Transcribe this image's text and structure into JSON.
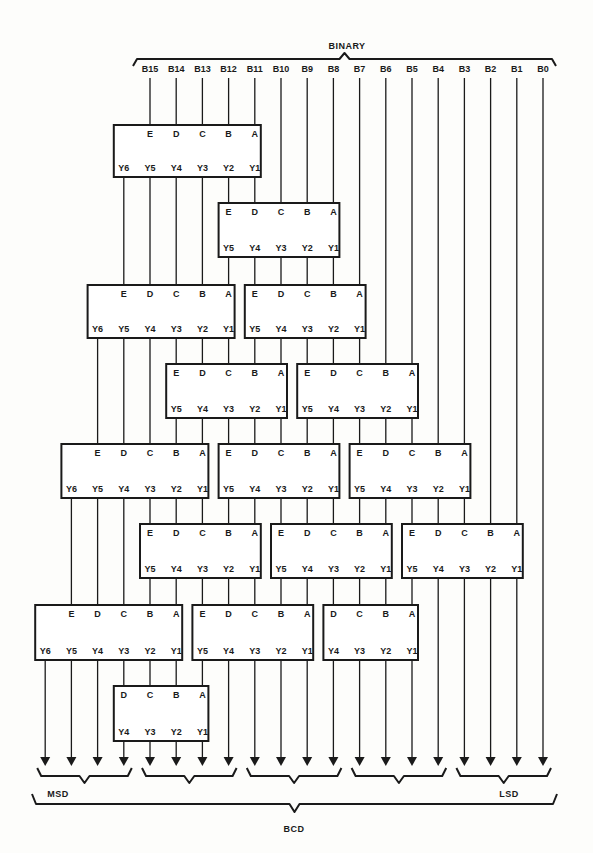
{
  "diagram": {
    "top_label": "BINARY",
    "bottom_label": "BCD",
    "msd_label": "MSD",
    "lsd_label": "LSD",
    "input_bits": [
      "B15",
      "B14",
      "B13",
      "B12",
      "B11",
      "B10",
      "B9",
      "B8",
      "B7",
      "B6",
      "B5",
      "B4",
      "B3",
      "B2",
      "B1",
      "B0"
    ],
    "column_x0": 150,
    "column_step": 26.2,
    "boxes": [
      {
        "id": "r1-a",
        "y": 125,
        "h": 52,
        "in_cols": [
          0,
          1,
          2,
          3,
          4
        ],
        "in_labels": [
          "E",
          "D",
          "C",
          "B",
          "A"
        ],
        "out_cols": [
          -1,
          0,
          1,
          2,
          3,
          4
        ],
        "out_labels": [
          "Y6",
          "Y5",
          "Y4",
          "Y3",
          "Y2",
          "Y1"
        ]
      },
      {
        "id": "r2-a",
        "y": 203,
        "h": 54,
        "in_cols": [
          3,
          4,
          5,
          6,
          7
        ],
        "in_labels": [
          "E",
          "D",
          "C",
          "B",
          "A"
        ],
        "out_cols": [
          3,
          4,
          5,
          6,
          7
        ],
        "out_labels": [
          "Y5",
          "Y4",
          "Y3",
          "Y2",
          "Y1"
        ]
      },
      {
        "id": "r3-a",
        "y": 285,
        "h": 53,
        "in_cols": [
          -1,
          0,
          1,
          2,
          3
        ],
        "in_labels": [
          "E",
          "D",
          "C",
          "B",
          "A"
        ],
        "out_cols": [
          -2,
          -1,
          0,
          1,
          2,
          3
        ],
        "out_labels": [
          "Y6",
          "Y5",
          "Y4",
          "Y3",
          "Y2",
          "Y1"
        ]
      },
      {
        "id": "r3-b",
        "y": 285,
        "h": 53,
        "in_cols": [
          4,
          5,
          6,
          7,
          8
        ],
        "in_labels": [
          "E",
          "D",
          "C",
          "B",
          "A"
        ],
        "out_cols": [
          4,
          5,
          6,
          7,
          8
        ],
        "out_labels": [
          "Y5",
          "Y4",
          "Y3",
          "Y2",
          "Y1"
        ]
      },
      {
        "id": "r4-a",
        "y": 364,
        "h": 54,
        "in_cols": [
          1,
          2,
          3,
          4,
          5
        ],
        "in_labels": [
          "E",
          "D",
          "C",
          "B",
          "A"
        ],
        "out_cols": [
          1,
          2,
          3,
          4,
          5
        ],
        "out_labels": [
          "Y5",
          "Y4",
          "Y3",
          "Y2",
          "Y1"
        ]
      },
      {
        "id": "r4-b",
        "y": 364,
        "h": 54,
        "in_cols": [
          6,
          7,
          8,
          9,
          10
        ],
        "in_labels": [
          "E",
          "D",
          "C",
          "B",
          "A"
        ],
        "out_cols": [
          6,
          7,
          8,
          9,
          10
        ],
        "out_labels": [
          "Y5",
          "Y4",
          "Y3",
          "Y2",
          "Y1"
        ]
      },
      {
        "id": "r5-a",
        "y": 444,
        "h": 54,
        "in_cols": [
          -2,
          -1,
          0,
          1,
          2
        ],
        "in_labels": [
          "E",
          "D",
          "C",
          "B",
          "A"
        ],
        "out_cols": [
          -3,
          -2,
          -1,
          0,
          1,
          2
        ],
        "out_labels": [
          "Y6",
          "Y5",
          "Y4",
          "Y3",
          "Y2",
          "Y1"
        ]
      },
      {
        "id": "r5-b",
        "y": 444,
        "h": 54,
        "in_cols": [
          3,
          4,
          5,
          6,
          7
        ],
        "in_labels": [
          "E",
          "D",
          "C",
          "B",
          "A"
        ],
        "out_cols": [
          3,
          4,
          5,
          6,
          7
        ],
        "out_labels": [
          "Y5",
          "Y4",
          "Y3",
          "Y2",
          "Y1"
        ]
      },
      {
        "id": "r5-c",
        "y": 444,
        "h": 54,
        "in_cols": [
          8,
          9,
          10,
          11,
          12
        ],
        "in_labels": [
          "E",
          "D",
          "C",
          "B",
          "A"
        ],
        "out_cols": [
          8,
          9,
          10,
          11,
          12
        ],
        "out_labels": [
          "Y5",
          "Y4",
          "Y3",
          "Y2",
          "Y1"
        ]
      },
      {
        "id": "r6-a",
        "y": 524,
        "h": 54,
        "in_cols": [
          0,
          1,
          2,
          3,
          4
        ],
        "in_labels": [
          "E",
          "D",
          "C",
          "B",
          "A"
        ],
        "out_cols": [
          0,
          1,
          2,
          3,
          4
        ],
        "out_labels": [
          "Y5",
          "Y4",
          "Y3",
          "Y2",
          "Y1"
        ]
      },
      {
        "id": "r6-b",
        "y": 524,
        "h": 54,
        "in_cols": [
          5,
          6,
          7,
          8,
          9
        ],
        "in_labels": [
          "E",
          "D",
          "C",
          "B",
          "A"
        ],
        "out_cols": [
          5,
          6,
          7,
          8,
          9
        ],
        "out_labels": [
          "Y5",
          "Y4",
          "Y3",
          "Y2",
          "Y1"
        ]
      },
      {
        "id": "r6-c",
        "y": 524,
        "h": 54,
        "in_cols": [
          10,
          11,
          12,
          13,
          14
        ],
        "in_labels": [
          "E",
          "D",
          "C",
          "B",
          "A"
        ],
        "out_cols": [
          10,
          11,
          12,
          13,
          14
        ],
        "out_labels": [
          "Y5",
          "Y4",
          "Y3",
          "Y2",
          "Y1"
        ]
      },
      {
        "id": "r7-a",
        "y": 605,
        "h": 55,
        "in_cols": [
          -3,
          -2,
          -1,
          0,
          1
        ],
        "in_labels": [
          "E",
          "D",
          "C",
          "B",
          "A"
        ],
        "out_cols": [
          -4,
          -3,
          -2,
          -1,
          0,
          1
        ],
        "out_labels": [
          "Y6",
          "Y5",
          "Y4",
          "Y3",
          "Y2",
          "Y1"
        ]
      },
      {
        "id": "r7-b",
        "y": 605,
        "h": 55,
        "in_cols": [
          2,
          3,
          4,
          5,
          6
        ],
        "in_labels": [
          "E",
          "D",
          "C",
          "B",
          "A"
        ],
        "out_cols": [
          2,
          3,
          4,
          5,
          6
        ],
        "out_labels": [
          "Y5",
          "Y4",
          "Y3",
          "Y2",
          "Y1"
        ]
      },
      {
        "id": "r7-c",
        "y": 605,
        "h": 55,
        "in_cols": [
          7,
          8,
          9,
          10
        ],
        "in_labels": [
          "D",
          "C",
          "B",
          "A"
        ],
        "out_cols": [
          7,
          8,
          9,
          10
        ],
        "out_labels": [
          "Y4",
          "Y3",
          "Y2",
          "Y1"
        ]
      },
      {
        "id": "r8-a",
        "y": 686,
        "h": 55,
        "in_cols": [
          -1,
          0,
          1,
          2
        ],
        "in_labels": [
          "D",
          "C",
          "B",
          "A"
        ],
        "out_cols": [
          -1,
          0,
          1,
          2
        ],
        "out_labels": [
          "Y4",
          "Y3",
          "Y2",
          "Y1"
        ]
      }
    ],
    "digit_groups": [
      [
        -4,
        -3,
        -2,
        -1
      ],
      [
        0,
        1,
        2,
        3
      ],
      [
        4,
        5,
        6,
        7
      ],
      [
        8,
        9,
        10,
        11
      ],
      [
        12,
        13,
        14,
        15
      ]
    ],
    "color_ink": "#1a1a1a",
    "color_paper": "#fdfdfb"
  }
}
